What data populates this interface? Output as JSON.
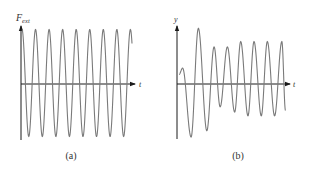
{
  "figure": {
    "panels": [
      {
        "id": "a",
        "caption": "(a)",
        "y_label_main": "F",
        "y_label_sub": "ext",
        "x_label": "t",
        "description": "Constant-amplitude sinusoidal external driving force"
      },
      {
        "id": "b",
        "caption": "(b)",
        "y_label_main": "y",
        "y_label_sub": "",
        "x_label": "t",
        "description": "Driven oscillator response: initial transient then steady-state oscillation"
      }
    ]
  },
  "chart_data": [
    {
      "type": "line",
      "title": "(a)",
      "xlabel": "t",
      "ylabel": "F_ext",
      "grid": false,
      "legend": null,
      "series": [
        {
          "name": "F_ext(t)",
          "description": "pure sinusoid, constant amplitude, ~8.5 cycles",
          "amplitude": 1.0,
          "cycles": 8.5,
          "peaks_x_px": [
            22,
            36,
            49,
            63,
            76,
            90,
            103,
            117,
            130
          ]
        }
      ]
    },
    {
      "type": "line",
      "title": "(b)",
      "xlabel": "t",
      "ylabel": "y",
      "grid": false,
      "legend": null,
      "series": [
        {
          "name": "y(t)",
          "description": "transient beats settling to steady-state amplitude",
          "points": [
            {
              "x": 0.0,
              "y": 0.18
            },
            {
              "x": 0.3,
              "y": 0.3
            },
            {
              "x": 1.0,
              "y": -1.0
            },
            {
              "x": 1.6,
              "y": 1.05
            },
            {
              "x": 2.3,
              "y": -0.88
            },
            {
              "x": 2.9,
              "y": 0.7
            },
            {
              "x": 3.4,
              "y": -0.43
            },
            {
              "x": 4.0,
              "y": 0.7
            },
            {
              "x": 4.6,
              "y": -0.53
            },
            {
              "x": 5.1,
              "y": 0.8
            },
            {
              "x": 5.7,
              "y": -0.6
            },
            {
              "x": 6.2,
              "y": 0.8
            },
            {
              "x": 6.8,
              "y": -0.6
            },
            {
              "x": 7.3,
              "y": 0.8
            },
            {
              "x": 7.9,
              "y": -0.6
            },
            {
              "x": 8.5,
              "y": 0.8
            },
            {
              "x": 8.8,
              "y": -0.5
            }
          ]
        }
      ]
    }
  ]
}
